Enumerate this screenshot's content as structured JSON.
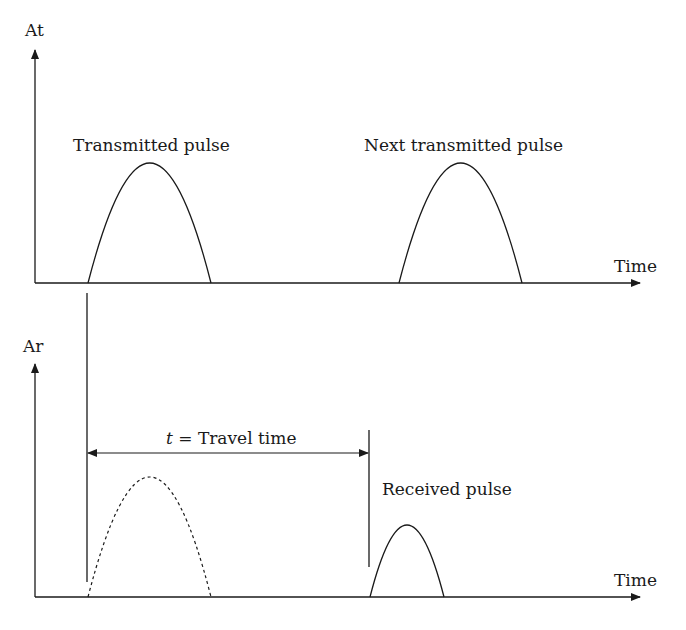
{
  "top_panel": {
    "y_axis_label": "At",
    "x_axis_label": "Time",
    "pulse1_label": "Transmitted pulse",
    "pulse2_label": "Next transmitted pulse"
  },
  "bottom_panel": {
    "y_axis_label": "Ar",
    "x_axis_label": "Time",
    "travel_var": "t",
    "travel_eq": " = Travel time",
    "received_label": "Received pulse"
  },
  "colors": {
    "line": "#1a1a1a",
    "background": "#ffffff"
  }
}
